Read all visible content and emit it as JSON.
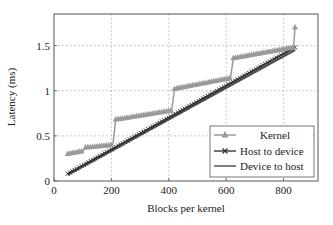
{
  "chart_data": {
    "type": "line",
    "title": "",
    "xlabel": "Blocks per kernel",
    "ylabel": "Latency (ms)",
    "xlim": [
      0,
      920
    ],
    "ylim": [
      0,
      1.85
    ],
    "xticks": [
      0,
      200,
      400,
      600,
      800
    ],
    "xtick_labels": [
      "0",
      "200",
      "400",
      "600",
      "800"
    ],
    "yticks": [
      0,
      0.5,
      1,
      1.5
    ],
    "ytick_labels": [
      "0",
      "0.5",
      "1",
      "1.5"
    ],
    "grid": true,
    "legend_position": "lower right",
    "series": [
      {
        "name": "Kernel",
        "marker": "triangle",
        "color": "#9a9a9a",
        "x": [
          48,
          100,
          110,
          205,
          215,
          410,
          420,
          615,
          625,
          835,
          840
        ],
        "y": [
          0.3,
          0.33,
          0.37,
          0.4,
          0.68,
          0.78,
          1.02,
          1.14,
          1.36,
          1.48,
          1.7
        ]
      },
      {
        "name": "Host to device",
        "marker": "x",
        "color": "#444444",
        "x": [
          48,
          840
        ],
        "y": [
          0.08,
          1.48
        ]
      },
      {
        "name": "Device to host",
        "marker": "none",
        "color": "#555555",
        "x": [
          48,
          840
        ],
        "y": [
          0.07,
          1.45
        ]
      }
    ]
  },
  "legend": {
    "items": [
      "Kernel",
      "Host to device",
      "Device to host"
    ]
  },
  "axes": {
    "xlabel": "Blocks per kernel",
    "ylabel": "Latency (ms)",
    "xticks": [
      "0",
      "200",
      "400",
      "600",
      "800"
    ],
    "yticks": [
      "0",
      "0.5",
      "1",
      "1.5"
    ]
  }
}
